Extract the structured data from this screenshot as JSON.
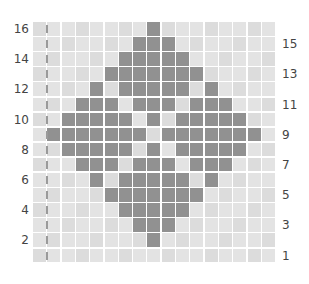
{
  "chart_data": {
    "type": "heatmap",
    "title": "",
    "columns": 17,
    "rows": 16,
    "row_labels_left": [
      "16",
      "14",
      "12",
      "10",
      "8",
      "6",
      "4",
      "2"
    ],
    "row_labels_right": [
      "15",
      "13",
      "11",
      "9",
      "7",
      "5",
      "3",
      "1"
    ],
    "row_order_top_to_bottom": [
      16,
      15,
      14,
      13,
      12,
      11,
      10,
      9,
      8,
      7,
      6,
      5,
      4,
      3,
      2,
      1
    ],
    "filled_columns_by_row": {
      "16": [
        8
      ],
      "15": [
        7,
        8,
        9
      ],
      "14": [
        6,
        7,
        8,
        9,
        10
      ],
      "13": [
        5,
        6,
        7,
        8,
        9,
        10,
        11
      ],
      "12": [
        4,
        6,
        7,
        8,
        9,
        10,
        12
      ],
      "11": [
        3,
        4,
        5,
        7,
        8,
        9,
        11,
        12,
        13
      ],
      "10": [
        2,
        3,
        4,
        5,
        6,
        8,
        10,
        11,
        12,
        13,
        14
      ],
      "9": [
        1,
        2,
        3,
        4,
        5,
        6,
        7,
        9,
        10,
        11,
        12,
        13,
        14,
        15
      ],
      "8": [
        2,
        3,
        4,
        5,
        6,
        8,
        10,
        11,
        12,
        13,
        14
      ],
      "7": [
        3,
        4,
        5,
        7,
        8,
        9,
        11,
        12,
        13
      ],
      "6": [
        4,
        6,
        7,
        8,
        9,
        10,
        12
      ],
      "5": [
        5,
        6,
        7,
        8,
        9,
        10,
        11
      ],
      "4": [
        6,
        7,
        8,
        9,
        10
      ],
      "3": [
        7,
        8,
        9
      ],
      "2": [
        8
      ],
      "1": []
    },
    "marker_column": 0,
    "colors": {
      "filled": "#919191",
      "empty": "#e3e3e3",
      "gap": "#ffffff",
      "marker": "#9a9a9a"
    }
  }
}
